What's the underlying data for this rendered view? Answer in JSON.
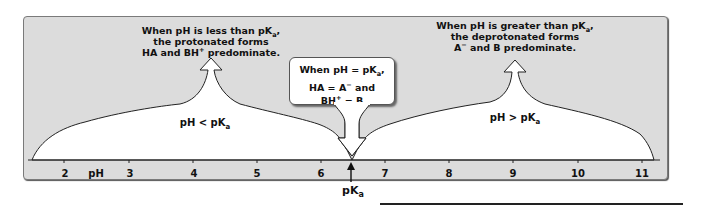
{
  "diagram": {
    "colors": {
      "frame_bg": "#dcdcdc",
      "frame_border": "#7a7a7a",
      "region_fill": "#ffffff",
      "line": "#222222",
      "text": "#111111"
    },
    "left_note": {
      "line1_pre": "When pH is less than pK",
      "line1_sub": "a",
      "line1_post": ",",
      "line2": "the protonated forms",
      "line3_pre": "HA and BH",
      "line3_sup": "+",
      "line3_post": " predominate."
    },
    "right_note": {
      "line1_pre": "When pH is greater than pK",
      "line1_sub": "a",
      "line1_post": ",",
      "line2": "the deprotonated forms",
      "line3_pre": "A",
      "line3_sup": "−",
      "line3_post": " and B predominate."
    },
    "center_callout": {
      "line1_pre": "When pH = pK",
      "line1_sub": "a",
      "line1_post": ",",
      "line2_pre": "HA = A",
      "line2_sup": "−",
      "line2_post": " and",
      "line3_pre": "BH",
      "line3_sup": "+",
      "line3_post": " = B"
    },
    "regions": {
      "left": {
        "label_pre": "pH < pK",
        "label_sub": "a"
      },
      "right": {
        "label_pre": "pH > pK",
        "label_sub": "a"
      }
    },
    "axis": {
      "label": "pH",
      "ticks": [
        "2",
        "3",
        "4",
        "5",
        "6",
        "7",
        "8",
        "9",
        "10",
        "11"
      ],
      "pka_marker": {
        "label_pre": "pK",
        "label_sub": "a",
        "position": 6.45
      }
    }
  }
}
